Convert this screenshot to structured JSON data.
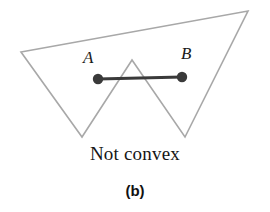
{
  "figure": {
    "caption": "Not convex",
    "subfigure_tag": "(b)",
    "width": 270,
    "height": 212,
    "background_color": "#ffffff"
  },
  "labels": {
    "point_a": "A",
    "point_b": "B"
  },
  "colors": {
    "polygon_stroke": "#a8a8a8",
    "polygon_fill": "none",
    "segment_stroke": "#3a3a3a",
    "point_fill": "#3a3a3a",
    "text": "#161616"
  },
  "chart_data": {
    "type": "diagram",
    "title": "Not convex",
    "subtitle": "(b)",
    "polygon": {
      "name": "non-convex-polygon",
      "closed": true,
      "stroke": "#a8a8a8",
      "stroke_width": 1.6,
      "fill": "none",
      "vertices": [
        {
          "name": "left-vertex",
          "x": 21,
          "y": 52
        },
        {
          "name": "top-right-vertex",
          "x": 248,
          "y": 11
        },
        {
          "name": "bottom-right-spike",
          "x": 185,
          "y": 137
        },
        {
          "name": "middle-reflex-peak",
          "x": 132,
          "y": 60
        },
        {
          "name": "bottom-left-spike",
          "x": 82,
          "y": 137
        }
      ]
    },
    "segment": {
      "name": "segment-ab",
      "stroke": "#3a3a3a",
      "stroke_width": 3.2,
      "from": {
        "label": "A",
        "x": 98,
        "y": 79
      },
      "to": {
        "label": "B",
        "x": 182,
        "y": 77
      }
    },
    "points": [
      {
        "label": "A",
        "x": 98,
        "y": 79,
        "radius": 5.2,
        "fill": "#3a3a3a"
      },
      {
        "label": "B",
        "x": 182,
        "y": 77,
        "radius": 5.2,
        "fill": "#3a3a3a"
      }
    ],
    "annotations": [
      {
        "text": "A",
        "x": 90,
        "y": 58,
        "style": "italic-serif"
      },
      {
        "text": "B",
        "x": 188,
        "y": 54,
        "style": "italic-serif"
      },
      {
        "text": "Not convex",
        "x": 135,
        "y": 160,
        "style": "serif"
      },
      {
        "text": "(b)",
        "x": 135,
        "y": 195,
        "style": "bold-sans"
      }
    ],
    "xlim": [
      0,
      270
    ],
    "ylim": [
      0,
      212
    ],
    "grid": false,
    "legend": null
  }
}
